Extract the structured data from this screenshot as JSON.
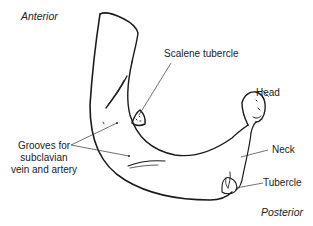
{
  "diagram": {
    "orientation_labels": {
      "anterior": "Anterior",
      "posterior": "Posterior"
    },
    "labels": {
      "scalene_tubercle": "Scalene tubercle",
      "head": "Head",
      "neck": "Neck",
      "tubercle": "Tubercle",
      "grooves_line1": "Grooves for",
      "grooves_line2": "subclavian",
      "grooves_line3": "vein and artery"
    },
    "colors": {
      "line": "#1a1a1a",
      "text": "#222222",
      "background": "#ffffff"
    }
  }
}
